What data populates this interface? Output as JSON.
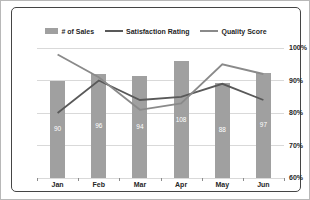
{
  "chart_data": {
    "type": "bar",
    "subtype": "combo-bar-line",
    "categories": [
      "Jan",
      "Feb",
      "Mar",
      "Apr",
      "May",
      "Jun"
    ],
    "series": [
      {
        "name": "# of Sales",
        "type": "bar",
        "values": [
          90,
          96,
          94,
          108,
          88,
          97
        ],
        "color": "#a0a0a0",
        "data_label_color": "#ffffff",
        "axis": "hidden-left",
        "axis_range": [
          0,
          120
        ]
      },
      {
        "name": "Satisfaction Rating",
        "type": "line",
        "values_percent": [
          80,
          90,
          84,
          85,
          89,
          84
        ],
        "color": "#595959",
        "axis": "right"
      },
      {
        "name": "Quality Score",
        "type": "line",
        "values_percent": [
          98,
          91,
          81,
          83,
          95,
          92
        ],
        "color": "#8a8a8a",
        "axis": "right"
      }
    ],
    "right_axis": {
      "tick_labels": [
        "100%",
        "90%",
        "80%",
        "70%",
        "60%"
      ],
      "min": 60,
      "max": 100,
      "unit": "%"
    },
    "grid": true,
    "gridline_color": "#d9d9d9",
    "legend_position": "top",
    "title": "",
    "xlabel": "",
    "ylabel": ""
  },
  "colors": {
    "frame_border": "#454545",
    "axis_line": "#8c8c8c",
    "bar_fill": "#a0a0a0"
  }
}
